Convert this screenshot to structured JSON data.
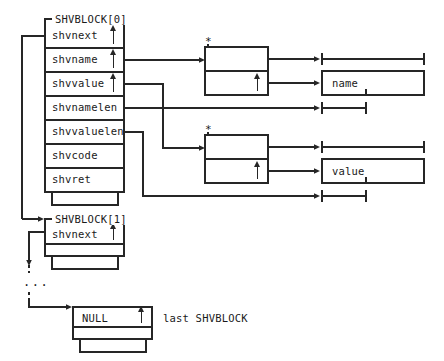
{
  "diagram": {
    "type": "memory-layout-pointer-diagram",
    "line_color": "#262626",
    "background": "#ffffff"
  },
  "blocks": [
    {
      "id": "shvblock0",
      "header": "SHVBLOCK[0]",
      "fields": [
        {
          "name": "shvnext",
          "pointer": true
        },
        {
          "name": "shvname",
          "pointer": true
        },
        {
          "name": "shvvalue",
          "pointer": true
        },
        {
          "name": "shvnamelen",
          "pointer": false
        },
        {
          "name": "shvvaluelen",
          "pointer": false
        },
        {
          "name": "shvcode",
          "pointer": false
        },
        {
          "name": "shvret",
          "pointer": false
        }
      ]
    },
    {
      "id": "shvblock1",
      "header": "SHVBLOCK[1]",
      "fields": [
        {
          "name": "shvnext",
          "pointer": true
        }
      ]
    },
    {
      "id": "shvblock_last",
      "header": "",
      "fields": [
        {
          "name": "NULL",
          "pointer": true
        }
      ],
      "note": "last SHVBLOCK"
    }
  ],
  "descriptors": [
    {
      "id": "name-descriptor",
      "marker": "*"
    },
    {
      "id": "value-descriptor",
      "marker": "*"
    }
  ],
  "buffers": [
    {
      "id": "name-buffer",
      "label": "name"
    },
    {
      "id": "value-buffer",
      "label": "value"
    }
  ],
  "ellipsis": "...",
  "markers": {
    "asterisk": "*",
    "pointer_arrow": "↑"
  }
}
